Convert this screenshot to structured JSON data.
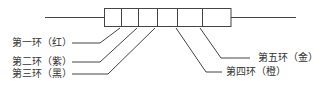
{
  "diagram": {
    "type": "resistor-color-bands",
    "labels": {
      "band1": "第一环（红）",
      "band2": "第二环（紫）",
      "band3": "第三环（黑）",
      "band4": "第四环（橙）",
      "band5": "第五环（金）"
    },
    "colors": {
      "stroke": "#444444",
      "background": "#ffffff"
    }
  }
}
